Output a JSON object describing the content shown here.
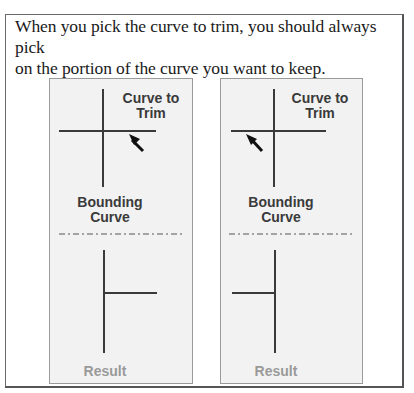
{
  "caption": {
    "line1": "When you pick the curve to trim, you should always pick",
    "line2": "on the portion of the curve you want to keep."
  },
  "panels": [
    {
      "id": "left",
      "curve_to_trim_label_1": "Curve to",
      "curve_to_trim_label_2": "Trim",
      "bounding_label_1": "Bounding",
      "bounding_label_2": "Curve",
      "result_label": "Result",
      "pick_side": "right"
    },
    {
      "id": "right",
      "curve_to_trim_label_1": "Curve to",
      "curve_to_trim_label_2": "Trim",
      "bounding_label_1": "Bounding",
      "bounding_label_2": "Curve",
      "result_label": "Result",
      "pick_side": "left"
    }
  ],
  "colors": {
    "line": "#3a3a3a",
    "panel_bg": "#f2f2f2",
    "result_text": "#9a9a9a"
  }
}
